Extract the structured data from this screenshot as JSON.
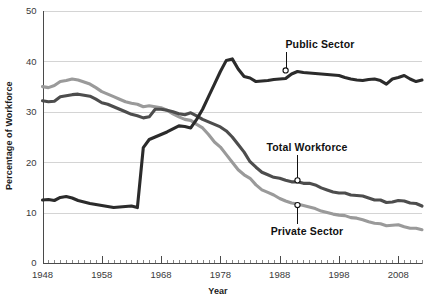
{
  "chart_data": {
    "type": "line",
    "title": "",
    "xlabel": "Year",
    "ylabel": "Percentage of Workforce",
    "xlim": [
      1948,
      2012
    ],
    "ylim": [
      0,
      50
    ],
    "grid": "horizontal",
    "legend_position": "inline-annotations",
    "y_ticks": [
      0,
      10,
      20,
      30,
      40,
      50
    ],
    "x_ticks": [
      1948,
      1958,
      1968,
      1978,
      1988,
      1998,
      2008
    ],
    "x_minor_tick_interval": 1,
    "series": [
      {
        "name": "Public Sector",
        "color": "#2b2b2b",
        "label_x": 1989,
        "label_value": 38.2,
        "x": [
          1948,
          1949,
          1950,
          1951,
          1952,
          1953,
          1954,
          1955,
          1956,
          1957,
          1958,
          1959,
          1960,
          1961,
          1962,
          1963,
          1964,
          1965,
          1966,
          1967,
          1968,
          1969,
          1970,
          1971,
          1972,
          1973,
          1974,
          1975,
          1976,
          1977,
          1978,
          1979,
          1980,
          1981,
          1982,
          1983,
          1984,
          1985,
          1986,
          1987,
          1988,
          1989,
          1990,
          1991,
          1992,
          1993,
          1994,
          1995,
          1996,
          1997,
          1998,
          1999,
          2000,
          2001,
          2002,
          2003,
          2004,
          2005,
          2006,
          2007,
          2008,
          2009,
          2010,
          2011,
          2012
        ],
        "values": [
          12.5,
          12.6,
          12.4,
          13.0,
          13.2,
          12.9,
          12.4,
          12.1,
          11.8,
          11.6,
          11.4,
          11.2,
          11.0,
          11.1,
          11.2,
          11.3,
          11.0,
          22.9,
          24.5,
          25.0,
          25.5,
          26.0,
          26.6,
          27.2,
          27.1,
          26.8,
          28.5,
          30.5,
          33.0,
          35.5,
          38.0,
          40.2,
          40.5,
          38.5,
          37.0,
          36.7,
          36.0,
          36.1,
          36.2,
          36.4,
          36.5,
          36.6,
          37.5,
          38.0,
          37.8,
          37.7,
          37.6,
          37.5,
          37.4,
          37.3,
          37.2,
          36.8,
          36.5,
          36.3,
          36.2,
          36.4,
          36.5,
          36.2,
          35.5,
          36.5,
          36.8,
          37.2,
          36.5,
          36.0,
          36.3
        ]
      },
      {
        "name": "Total Workforce",
        "color": "#4d4d4d",
        "label_x": 1991,
        "label_value": 16.4,
        "x": [
          1948,
          1949,
          1950,
          1951,
          1952,
          1953,
          1954,
          1955,
          1956,
          1957,
          1958,
          1959,
          1960,
          1961,
          1962,
          1963,
          1964,
          1965,
          1966,
          1967,
          1968,
          1969,
          1970,
          1971,
          1972,
          1973,
          1974,
          1975,
          1976,
          1977,
          1978,
          1979,
          1980,
          1981,
          1982,
          1983,
          1984,
          1985,
          1986,
          1987,
          1988,
          1989,
          1990,
          1991,
          1992,
          1993,
          1994,
          1995,
          1996,
          1997,
          1998,
          1999,
          2000,
          2001,
          2002,
          2003,
          2004,
          2005,
          2006,
          2007,
          2008,
          2009,
          2010,
          2011,
          2012
        ],
        "values": [
          32.2,
          32.0,
          32.1,
          33.0,
          33.2,
          33.4,
          33.5,
          33.3,
          33.1,
          32.5,
          31.8,
          31.5,
          31.0,
          30.5,
          30.0,
          29.5,
          29.2,
          28.8,
          29.0,
          30.5,
          30.5,
          30.3,
          30.0,
          29.6,
          29.4,
          29.8,
          29.2,
          28.5,
          28.0,
          27.5,
          27.0,
          26.2,
          25.0,
          23.5,
          22.0,
          20.1,
          19.0,
          18.0,
          17.5,
          17.0,
          16.8,
          16.4,
          16.1,
          16.1,
          15.8,
          15.8,
          15.5,
          14.9,
          14.5,
          14.1,
          13.9,
          13.9,
          13.5,
          13.4,
          13.3,
          12.9,
          12.5,
          12.5,
          12.0,
          12.1,
          12.4,
          12.3,
          11.9,
          11.8,
          11.3
        ]
      },
      {
        "name": "Private Sector",
        "color": "#9a9a9a",
        "label_x": 1991,
        "label_value": 11.5,
        "x": [
          1948,
          1949,
          1950,
          1951,
          1952,
          1953,
          1954,
          1955,
          1956,
          1957,
          1958,
          1959,
          1960,
          1961,
          1962,
          1963,
          1964,
          1965,
          1966,
          1967,
          1968,
          1969,
          1970,
          1971,
          1972,
          1973,
          1974,
          1975,
          1976,
          1977,
          1978,
          1979,
          1980,
          1981,
          1982,
          1983,
          1984,
          1985,
          1986,
          1987,
          1988,
          1989,
          1990,
          1991,
          1992,
          1993,
          1994,
          1995,
          1996,
          1997,
          1998,
          1999,
          2000,
          2001,
          2002,
          2003,
          2004,
          2005,
          2006,
          2007,
          2008,
          2009,
          2010,
          2011,
          2012
        ],
        "values": [
          35.0,
          34.8,
          35.2,
          36.0,
          36.2,
          36.5,
          36.3,
          35.9,
          35.5,
          34.8,
          34.0,
          33.5,
          33.0,
          32.5,
          32.0,
          31.7,
          31.5,
          31.0,
          31.2,
          31.0,
          30.8,
          30.3,
          29.6,
          29.0,
          28.5,
          28.3,
          27.5,
          26.8,
          25.5,
          24.0,
          23.0,
          21.5,
          20.0,
          18.5,
          17.5,
          16.8,
          15.5,
          14.5,
          14.0,
          13.5,
          12.8,
          12.3,
          11.9,
          11.7,
          11.4,
          11.1,
          10.8,
          10.3,
          10.0,
          9.7,
          9.5,
          9.4,
          9.0,
          8.9,
          8.6,
          8.2,
          7.9,
          7.8,
          7.4,
          7.5,
          7.6,
          7.2,
          6.9,
          6.9,
          6.6
        ]
      }
    ]
  },
  "axes": {
    "y_title": "Percentage of Workforce",
    "x_title": "Year",
    "y_tick_labels": [
      "0",
      "10",
      "20",
      "30",
      "40",
      "50"
    ],
    "x_tick_labels": [
      "1948",
      "1958",
      "1968",
      "1978",
      "1988",
      "1998",
      "2008"
    ]
  },
  "annotations": [
    {
      "name": "public-sector",
      "text": "Public Sector"
    },
    {
      "name": "total-workforce",
      "text": "Total Workforce"
    },
    {
      "name": "private-sector",
      "text": "Private Sector"
    }
  ],
  "colors": {
    "public_sector": "#2b2b2b",
    "total_workforce": "#4d4d4d",
    "private_sector": "#9a9a9a",
    "gridline": "#c9c9c9",
    "axis": "#4a4a4a",
    "text": "#231f20",
    "background": "#ffffff"
  }
}
